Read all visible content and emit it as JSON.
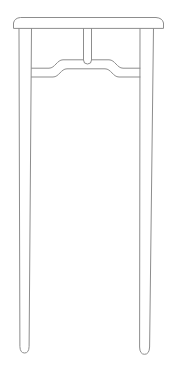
{
  "illustration": {
    "description": "Line drawing of a tall slender side table with a humpback stretcher and center post",
    "background_color": "#ffffff",
    "line_color": "#8d8d8d",
    "canvas": {
      "width": "173",
      "height": "370"
    }
  }
}
